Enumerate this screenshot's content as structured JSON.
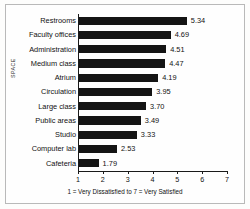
{
  "chart_data": {
    "type": "bar",
    "orientation": "horizontal",
    "title": "",
    "xlabel": "1 = Very Dissatisfied to 7 = Very Satisfied",
    "ylabel": "SPACE",
    "xlim": [
      1,
      7
    ],
    "xticks": [
      "1",
      "2",
      "3",
      "4",
      "5",
      "6",
      "7"
    ],
    "grid": false,
    "legend": false,
    "bar_color": "#141414",
    "categories": [
      "Restrooms",
      "Faculty offices",
      "Administration",
      "Medium class",
      "Atrium",
      "Circulation",
      "Large class",
      "Public areas",
      "Studio",
      "Computer lab",
      "Cafeteria"
    ],
    "values": [
      5.34,
      4.69,
      4.51,
      4.47,
      4.19,
      3.95,
      3.7,
      3.49,
      3.33,
      2.53,
      1.79
    ],
    "value_labels": [
      "5.34",
      "4.69",
      "4.51",
      "4.47",
      "4.19",
      "3.95",
      "3.70",
      "3.49",
      "3.33",
      "2.53",
      "1.79"
    ]
  },
  "figure": {
    "border_color": "#b9b9b9",
    "background": "#fefefe"
  }
}
